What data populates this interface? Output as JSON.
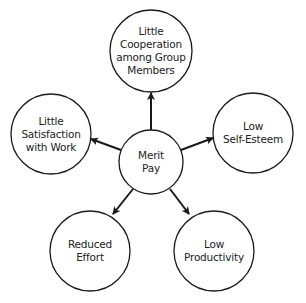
{
  "diagram": {
    "type": "hub-and-spoke",
    "stroke_color": "#1a1a1a",
    "center": {
      "id": "merit-pay",
      "lines": [
        "Merit",
        "Pay"
      ],
      "cx": 151,
      "cy": 162,
      "r": 32
    },
    "outcomes": [
      {
        "id": "little-cooperation",
        "lines": [
          "Little",
          "Cooperation",
          "among Group",
          "Members"
        ],
        "cx": 151,
        "cy": 51,
        "r": 41
      },
      {
        "id": "little-satisfaction",
        "lines": [
          "Little",
          "Satisfaction",
          "with Work"
        ],
        "cx": 51,
        "cy": 134,
        "r": 40
      },
      {
        "id": "low-self-esteem",
        "lines": [
          "Low",
          "Self-Esteem"
        ],
        "cx": 253,
        "cy": 133,
        "r": 40
      },
      {
        "id": "reduced-effort",
        "lines": [
          "Reduced",
          "Effort"
        ],
        "cx": 90,
        "cy": 251,
        "r": 40
      },
      {
        "id": "low-productivity",
        "lines": [
          "Low",
          "Productivity"
        ],
        "cx": 214,
        "cy": 251,
        "r": 40
      }
    ],
    "arrows": [
      {
        "from": "merit-pay",
        "to": "little-cooperation",
        "x1": 151,
        "y1": 130,
        "x2": 151,
        "y2": 93
      },
      {
        "from": "merit-pay",
        "to": "little-satisfaction",
        "x1": 121,
        "y1": 150,
        "x2": 91,
        "y2": 139
      },
      {
        "from": "merit-pay",
        "to": "low-self-esteem",
        "x1": 181,
        "y1": 150,
        "x2": 213,
        "y2": 138
      },
      {
        "from": "merit-pay",
        "to": "reduced-effort",
        "x1": 133,
        "y1": 189,
        "x2": 113,
        "y2": 214
      },
      {
        "from": "merit-pay",
        "to": "low-productivity",
        "x1": 170,
        "y1": 189,
        "x2": 189,
        "y2": 214
      }
    ]
  }
}
